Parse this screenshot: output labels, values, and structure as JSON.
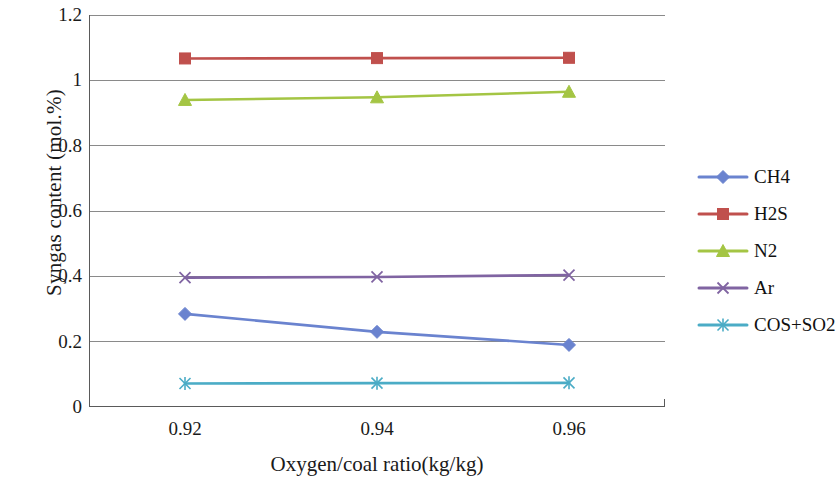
{
  "chart_data": {
    "type": "line",
    "title": "",
    "xlabel": "Oxygen/coal ratio(kg/kg)",
    "ylabel": "Syngas content (mol.%)",
    "categories": [
      "0.92",
      "0.94",
      "0.96"
    ],
    "x": [
      0.92,
      0.94,
      0.96
    ],
    "xtick_labels": [
      "0.92",
      "0.94",
      "0.96"
    ],
    "ytick_labels": [
      "0",
      "0.2",
      "0.4",
      "0.6",
      "0.8",
      "1",
      "1.2"
    ],
    "ytick_values": [
      0,
      0.2,
      0.4,
      0.6,
      0.8,
      1.0,
      1.2
    ],
    "ylim": [
      0,
      1.2
    ],
    "grid": "horizontal",
    "legend_position": "right",
    "series": [
      {
        "name": "CH4",
        "values": [
          0.285,
          0.23,
          0.19
        ],
        "color": "#6A83CF",
        "marker": "diamond"
      },
      {
        "name": "H2S",
        "values": [
          1.067,
          1.068,
          1.069
        ],
        "color": "#C0504D",
        "marker": "square"
      },
      {
        "name": "N2",
        "values": [
          0.94,
          0.948,
          0.965
        ],
        "color": "#A4C544",
        "marker": "triangle"
      },
      {
        "name": "Ar",
        "values": [
          0.396,
          0.398,
          0.404
        ],
        "color": "#8064A2",
        "marker": "x"
      },
      {
        "name": "COS+SO2",
        "values": [
          0.072,
          0.073,
          0.074
        ],
        "color": "#4BACC6",
        "marker": "asterisk"
      }
    ]
  },
  "legend": {
    "entries": [
      {
        "label": "CH4"
      },
      {
        "label": "H2S"
      },
      {
        "label": "N2"
      },
      {
        "label": "Ar"
      },
      {
        "label": "COS+SO2"
      }
    ]
  },
  "colors": {
    "axis": "#5a5a5a",
    "grid": "#8a8a8a",
    "text": "#1a1a1a",
    "background": "#ffffff"
  }
}
